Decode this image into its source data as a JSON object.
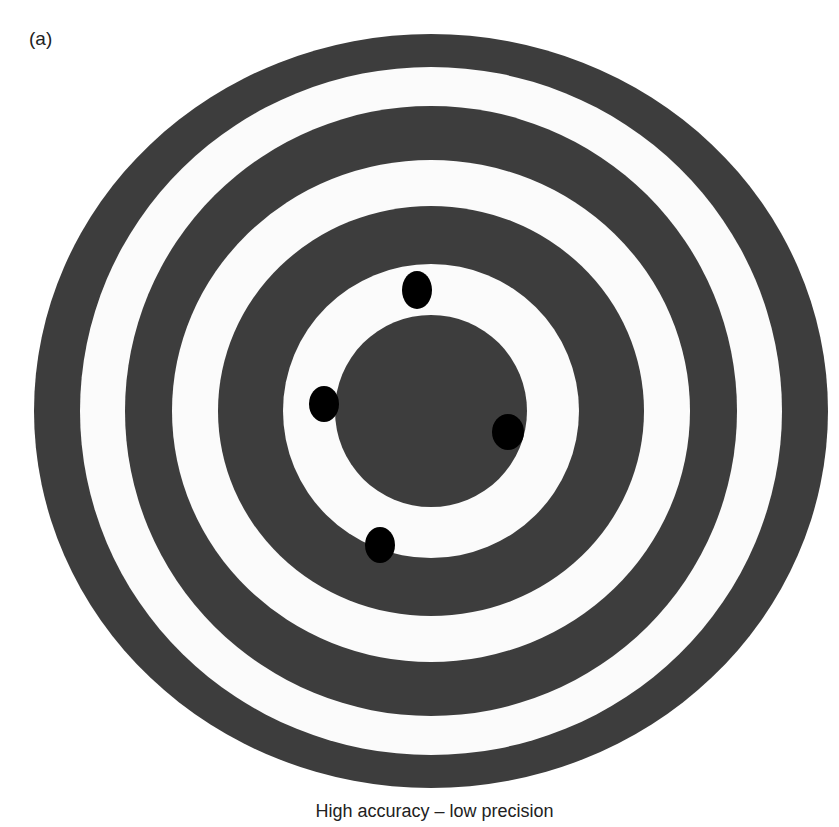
{
  "panel_label": "(a)",
  "caption": "High accuracy – low precision",
  "colors": {
    "ring_dark": "#3d3d3d",
    "ring_light": "#fbfbfb",
    "hit": "#000000",
    "background": "#ffffff"
  },
  "target": {
    "center": [
      431,
      411
    ],
    "rings": [
      {
        "rx": 397,
        "ry": 377,
        "fill": "dark"
      },
      {
        "rx": 351,
        "ry": 344,
        "fill": "light"
      },
      {
        "rx": 306,
        "ry": 305,
        "fill": "dark"
      },
      {
        "rx": 259,
        "ry": 251,
        "fill": "light"
      },
      {
        "rx": 213,
        "ry": 205,
        "fill": "dark"
      },
      {
        "rx": 148,
        "ry": 147,
        "fill": "light"
      },
      {
        "rx": 96,
        "ry": 96,
        "fill": "dark"
      }
    ]
  },
  "hits": [
    {
      "name": "hit-top",
      "cx": 417,
      "cy": 290,
      "rx": 15,
      "ry": 19
    },
    {
      "name": "hit-left",
      "cx": 324,
      "cy": 404,
      "rx": 15,
      "ry": 18
    },
    {
      "name": "hit-right",
      "cx": 508,
      "cy": 432,
      "rx": 16,
      "ry": 18
    },
    {
      "name": "hit-bottom",
      "cx": 380,
      "cy": 545,
      "rx": 15,
      "ry": 18
    }
  ]
}
